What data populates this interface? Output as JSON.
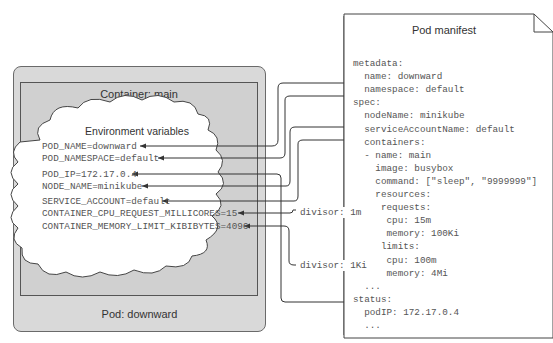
{
  "pod": {
    "label": "Pod: downward"
  },
  "container": {
    "label": "Container: main"
  },
  "env": {
    "title": "Environment variables",
    "vars": [
      "POD_NAME=downward",
      "POD_NAMESPACE=default",
      "POD_IP=172.17.0.4",
      "NODE_NAME=minikube",
      "SERVICE_ACCOUNT=default",
      "CONTAINER_CPU_REQUEST_MILLICORES=15",
      "CONTAINER_MEMORY_LIMIT_KIBIBYTES=4096"
    ]
  },
  "divisors": {
    "cpu": "divisor: 1m",
    "memory": "divisor: 1Ki"
  },
  "manifest": {
    "title": "Pod manifest",
    "lines": [
      "metadata:",
      "  name: downward",
      "  namespace: default",
      "spec:",
      "  nodeName: minikube",
      "  serviceAccountName: default",
      "  containers:",
      "  - name: main",
      "    image: busybox",
      "    command: [\"sleep\", \"9999999\"]",
      "    resources:",
      "     requests:",
      "      cpu: 15m",
      "      memory: 100Ki",
      "     limits:",
      "      cpu: 100m",
      "      memory: 4Mi",
      "  ...",
      "status:",
      "  podIP: 172.17.0.4",
      "  ..."
    ]
  }
}
